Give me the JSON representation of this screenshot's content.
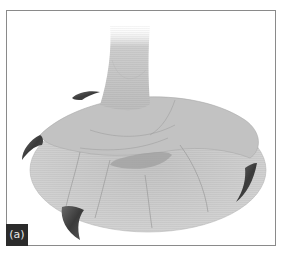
{
  "figure": {
    "panel_label": "(a)",
    "colors": {
      "frame_border": "#8a8a8a",
      "foot_fill": "#c9c9c9",
      "foot_fill_light": "#dcdcdc",
      "shadow": "#9a9a9a",
      "talon": "#4a4a4a",
      "label_bg": "#2b2b2b",
      "label_text": "#e8e8e8"
    }
  }
}
